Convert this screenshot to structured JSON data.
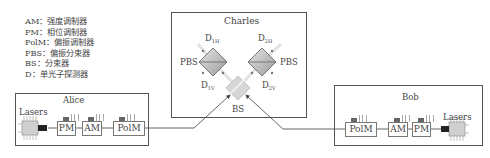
{
  "legend": [
    "AM：强度调制器",
    "PM：相位调制器",
    "PolM：偏振调制器",
    "PBS：偏振分束器",
    "BS：分束器",
    "D：单光子探测器"
  ],
  "charles": {
    "title": "Charles",
    "pbs_left": "PBS",
    "pbs_right": "PBS",
    "bs": "BS",
    "detectors": {
      "top_left": {
        "main": "D",
        "sub": "1H"
      },
      "top_right": {
        "main": "D",
        "sub": "2H"
      },
      "bottom_left": {
        "main": "D",
        "sub": "1V"
      },
      "bottom_right": {
        "main": "D",
        "sub": "2V"
      }
    }
  },
  "alice": {
    "title": "Alice",
    "lasers": "Lasers",
    "modules": [
      "PM",
      "AM",
      "PolM"
    ]
  },
  "bob": {
    "title": "Bob",
    "lasers": "Lasers",
    "modules": [
      "PolM",
      "AM",
      "PM"
    ]
  },
  "colors": {
    "line": "#555555",
    "diamond_fill": "#c8c8c8",
    "diamond_dark": "#a0a0a0"
  }
}
